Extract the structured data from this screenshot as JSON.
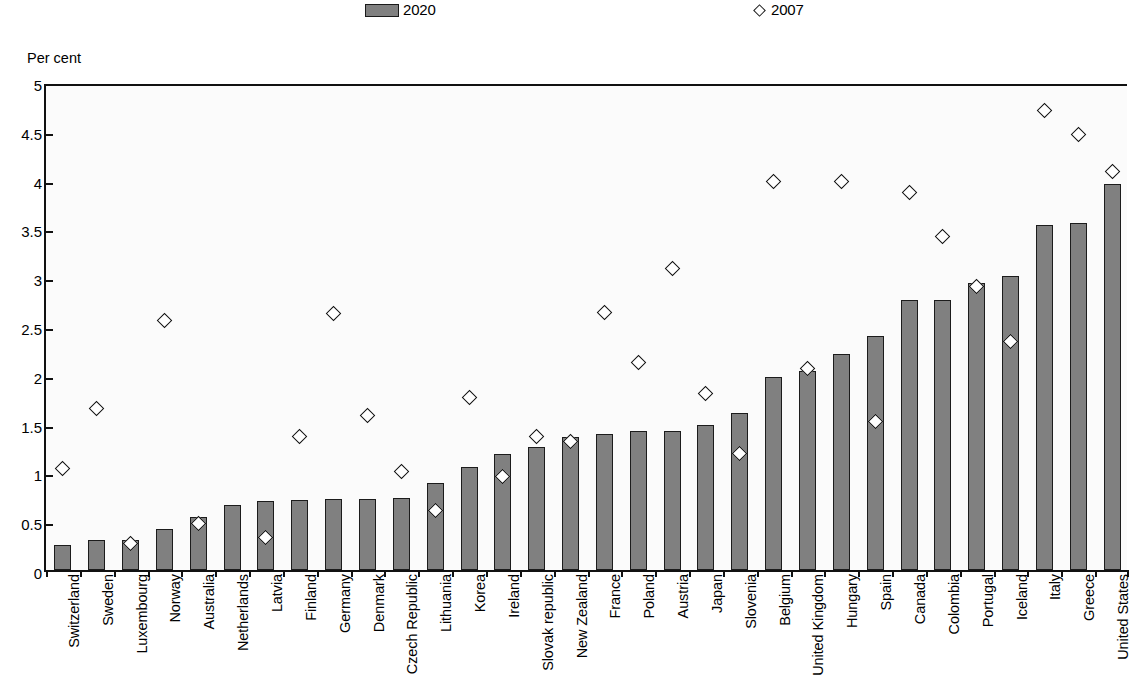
{
  "legend": {
    "bar_series_label": "2020",
    "diamond_series_label": "2007"
  },
  "axis": {
    "unit_caption": "Per cent"
  },
  "chart_data": {
    "type": "bar",
    "title": "",
    "subtitle": "",
    "xlabel": "",
    "ylabel": "Per cent",
    "ylim": [
      0,
      5
    ],
    "yticks": [
      "0",
      "0.5",
      "1",
      "1.5",
      "2",
      "2.5",
      "3",
      "3.5",
      "4",
      "4.5",
      "5"
    ],
    "ytick_values": [
      0,
      0.5,
      1,
      1.5,
      2,
      2.5,
      3,
      3.5,
      4,
      4.5,
      5
    ],
    "grid": false,
    "legend_position": "top",
    "categories": [
      "Switzerland",
      "Sweden",
      "Luxembourg",
      "Norway",
      "Australia",
      "Netherlands",
      "Latvia",
      "Finland",
      "Germany",
      "Denmark",
      "Czech Republic",
      "Lithuania",
      "Korea",
      "Ireland",
      "Slovak republic",
      "New Zealand",
      "France",
      "Poland",
      "Austria",
      "Japan",
      "Slovenia",
      "Belgium",
      "United Kingdom",
      "Hungary",
      "Spain",
      "Canada",
      "Colombia",
      "Portugal",
      "Iceland",
      "Italy",
      "Greece",
      "United States"
    ],
    "series": [
      {
        "name": "2020",
        "type": "bar",
        "values": [
          0.26,
          0.31,
          0.31,
          0.42,
          0.54,
          0.67,
          0.71,
          0.72,
          0.73,
          0.73,
          0.74,
          0.89,
          1.06,
          1.19,
          1.26,
          1.36,
          1.39,
          1.42,
          1.42,
          1.49,
          1.61,
          1.98,
          2.04,
          2.21,
          2.4,
          2.77,
          2.77,
          2.94,
          3.01,
          3.54,
          3.56,
          3.96
        ]
      },
      {
        "name": "2007",
        "type": "scatter",
        "marker": "diamond",
        "values": [
          1.08,
          1.7,
          0.31,
          2.6,
          0.52,
          null,
          0.37,
          1.41,
          2.67,
          1.62,
          1.05,
          0.65,
          1.81,
          1.0,
          1.41,
          1.36,
          2.68,
          2.17,
          3.13,
          1.85,
          1.23,
          4.02,
          2.11,
          4.02,
          1.56,
          3.91,
          3.46,
          2.95,
          2.38,
          4.75,
          4.5,
          4.12
        ]
      }
    ]
  }
}
